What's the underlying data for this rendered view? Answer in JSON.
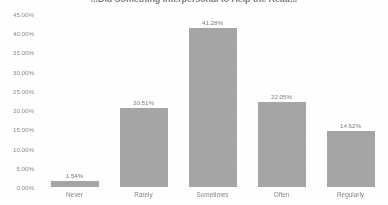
{
  "chart_data": {
    "type": "bar",
    "title": "...Did Something Interpersonal to Help the Relat...",
    "xlabel": "",
    "ylabel": "",
    "categories": [
      "Never",
      "Rarely",
      "Sometimes",
      "Often",
      "Regularly"
    ],
    "values": [
      1.54,
      20.51,
      41.28,
      22.05,
      14.62
    ],
    "data_labels": [
      "1.54%",
      "20.51%",
      "41.28%",
      "22.05%",
      "14.62%"
    ],
    "ylim": [
      0,
      45
    ],
    "ytick_values": [
      45,
      40,
      35,
      30,
      25,
      20,
      15,
      10,
      5,
      0
    ],
    "ytick_labels": [
      "45.00%",
      "40.00%",
      "35.00%",
      "30.00%",
      "25.00%",
      "20.00%",
      "15.00%",
      "10.00%",
      "5.00%",
      "0.00%"
    ],
    "grid": false,
    "legend": "none",
    "series_color": "#a6a6a6"
  }
}
